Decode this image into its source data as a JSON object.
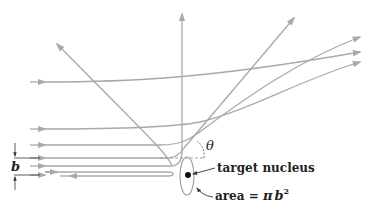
{
  "diagram": {
    "labels": {
      "theta": "θ",
      "impact_parameter": "b",
      "target": "target nucleus",
      "area_prefix": "area = ",
      "area_pi": "π",
      "area_b": "b",
      "area_exp": "2"
    },
    "colors": {
      "trajectory": "#a9a9a9",
      "nucleus": "#111111",
      "text": "#222222"
    },
    "trajectories": [
      {
        "id": "near-straight",
        "incoming_y": 82,
        "exit": "upper-right"
      },
      {
        "id": "small-angle-1",
        "incoming_y": 129,
        "exit": "upper-right"
      },
      {
        "id": "small-angle-2",
        "incoming_y": 145,
        "exit": "upper-right"
      },
      {
        "id": "large-angle",
        "incoming_y": 158,
        "exit": "upper-left"
      },
      {
        "id": "right-angle",
        "incoming_y": 166,
        "exit": "up"
      },
      {
        "id": "backscatter",
        "incoming_y": 175,
        "exit": "back-left"
      }
    ]
  }
}
